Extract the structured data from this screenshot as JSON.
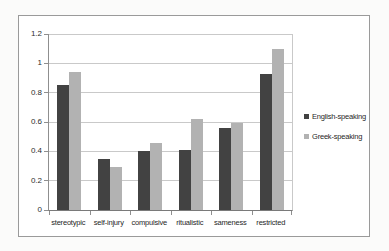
{
  "chart_data": {
    "type": "bar",
    "title": "",
    "xlabel": "",
    "ylabel": "",
    "categories": [
      "stereotypic",
      "self-injury",
      "compulsive",
      "ritualistic",
      "sameness",
      "restricted"
    ],
    "series": [
      {
        "name": "English-speaking",
        "color": "#424242",
        "values": [
          0.85,
          0.35,
          0.4,
          0.41,
          0.56,
          0.93
        ]
      },
      {
        "name": "Greek-speaking",
        "color": "#b2b2b2",
        "values": [
          0.94,
          0.29,
          0.46,
          0.62,
          0.59,
          1.1
        ]
      }
    ],
    "ylim": [
      0,
      1.2
    ],
    "yticks": [
      "0",
      "0.2",
      "0.4",
      "0.6",
      "0.8",
      "1",
      "1.2"
    ],
    "grid": true,
    "legend_position": "right"
  },
  "colors": {
    "series_english": "#424242",
    "series_greek": "#b2b2b2",
    "gridline": "#c9c9c9",
    "axis": "#8f8f8f",
    "frame_border": "#9a9a9a",
    "background": "#ffffff"
  }
}
